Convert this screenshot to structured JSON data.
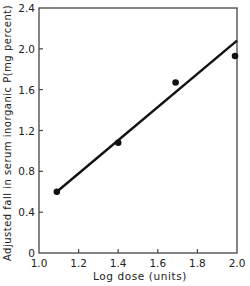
{
  "chart_data": {
    "type": "scatter",
    "title": "",
    "xlabel": "Log dose (units)",
    "ylabel": "Adjusted fall in serum inorganic P(mg percent)",
    "xlim": [
      1.0,
      2.0
    ],
    "ylim": [
      0,
      2.4
    ],
    "x_ticks": [
      "1.0",
      "1.2",
      "1.4",
      "1.6",
      "1.8",
      "2.0"
    ],
    "y_ticks": [
      "0",
      "0.4",
      "0.8",
      "1.2",
      "1.6",
      "2.0",
      "2.4"
    ],
    "grid": false,
    "legend": null,
    "series": [
      {
        "name": "observed",
        "marker": "filled-circle",
        "points": [
          {
            "x": 1.09,
            "y": 0.6
          },
          {
            "x": 1.4,
            "y": 1.08
          },
          {
            "x": 1.69,
            "y": 1.67
          },
          {
            "x": 1.99,
            "y": 1.93
          }
        ]
      },
      {
        "name": "fitted-line",
        "type": "line",
        "points": [
          {
            "x": 1.09,
            "y": 0.6
          },
          {
            "x": 2.0,
            "y": 2.08
          }
        ]
      }
    ]
  },
  "colors": {
    "ink": "#111111",
    "background": "#ffffff"
  }
}
